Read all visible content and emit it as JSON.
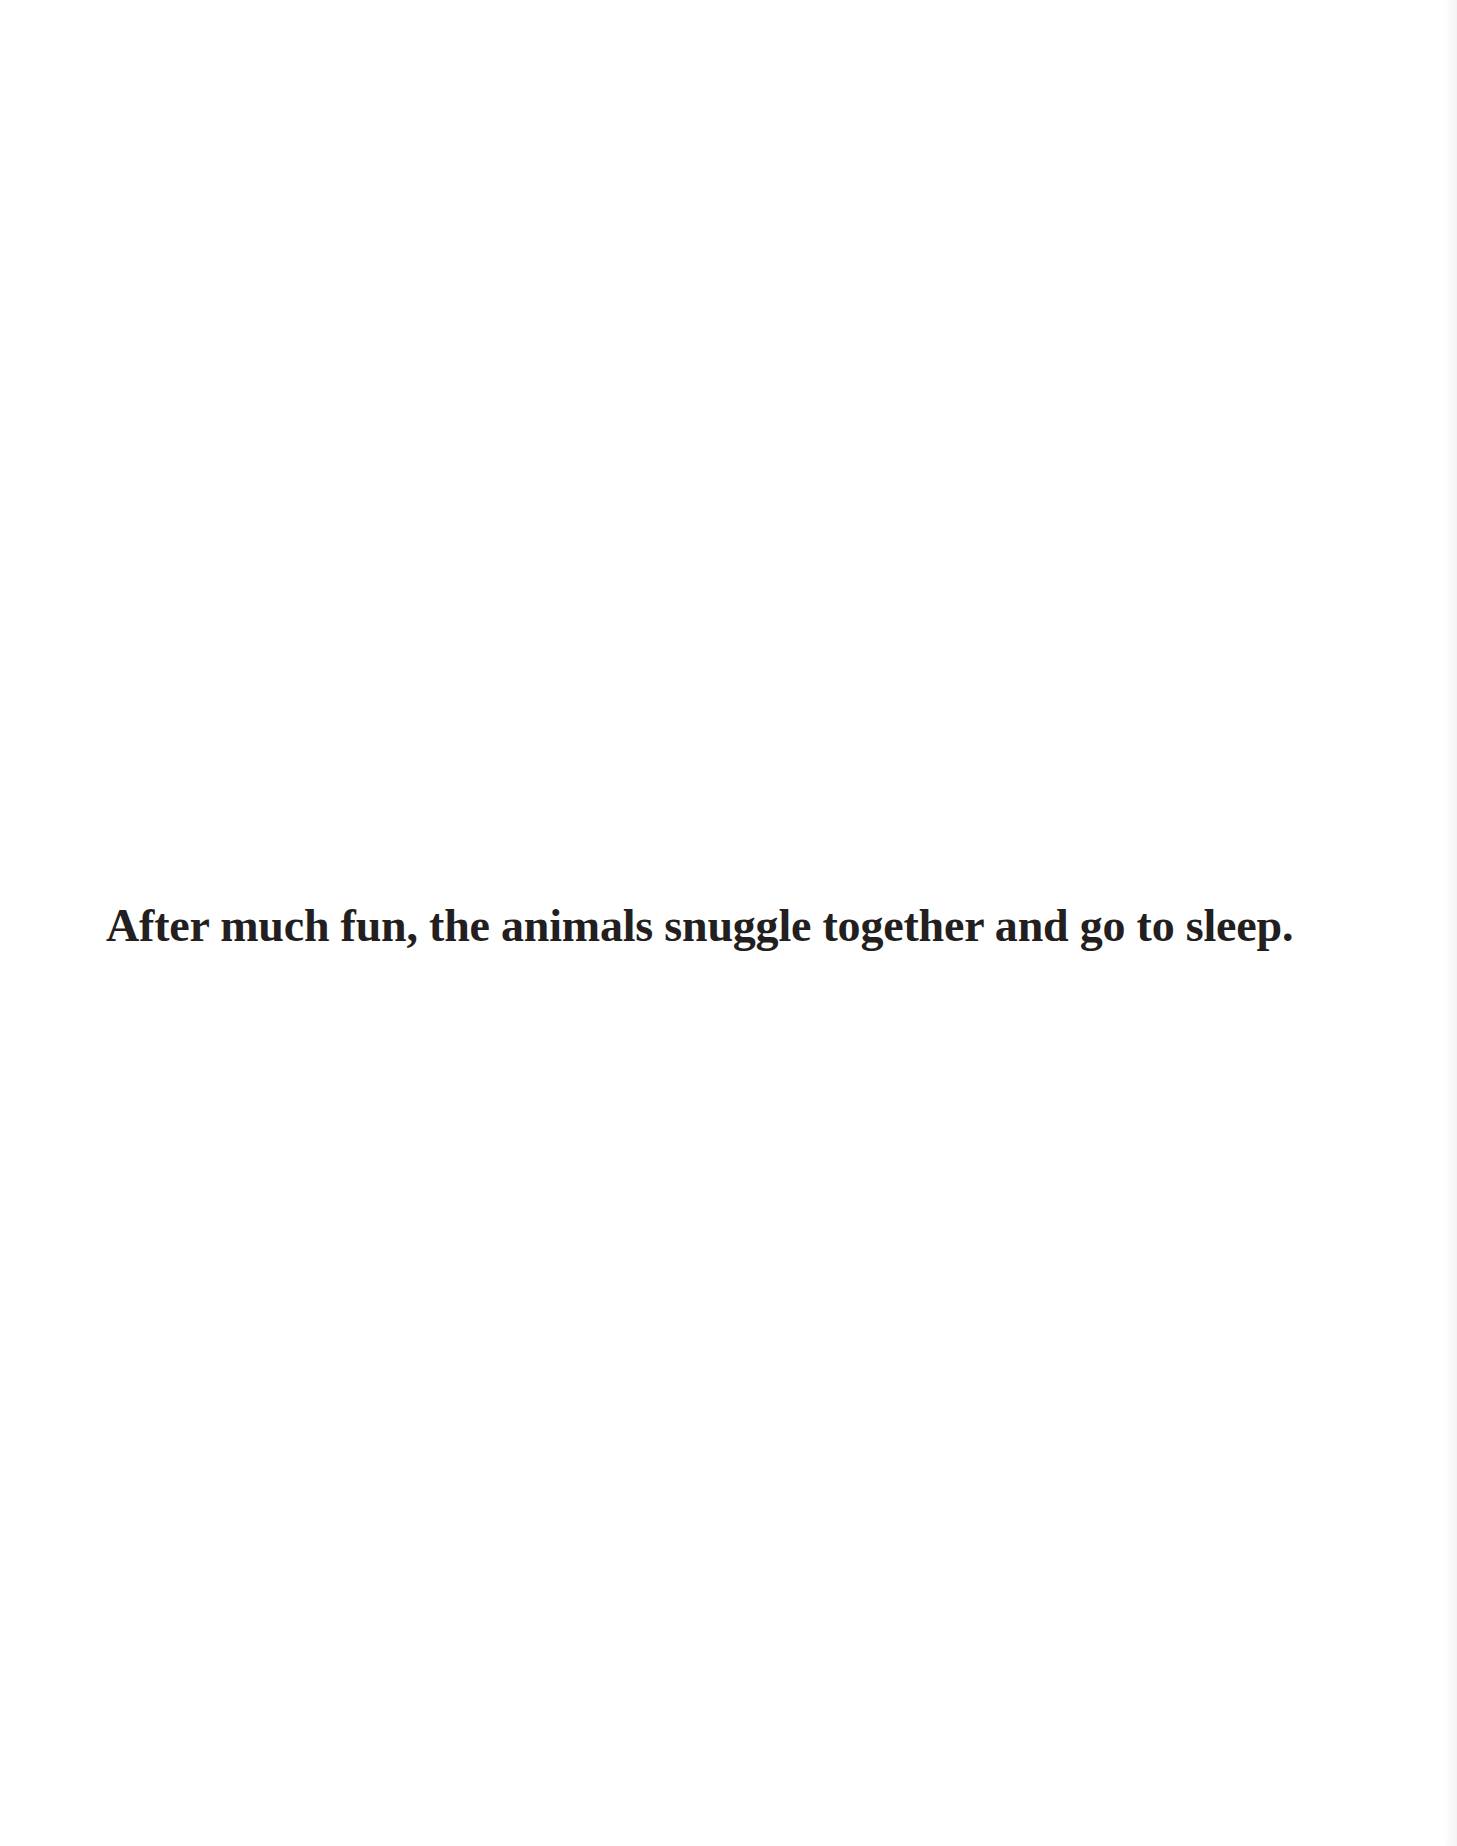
{
  "page": {
    "background_color": "#ffffff",
    "text_color": "#231f20",
    "caption": "After much fun, the animals snuggle together and go to sleep."
  }
}
